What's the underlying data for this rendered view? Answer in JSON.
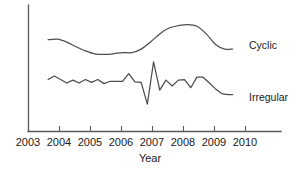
{
  "chart_data": {
    "type": "line",
    "title": "",
    "subtitle": "",
    "xlabel": "Year",
    "ylabel": "",
    "grid": false,
    "legend_position": "right-inline-labels",
    "xlim": [
      2003,
      2010
    ],
    "xticks": [
      2003,
      2004,
      2005,
      2006,
      2007,
      2008,
      2009,
      2010
    ],
    "xticklabels": [
      "2003",
      "2004",
      "2005",
      "2006",
      "2007",
      "2008",
      "2009",
      "2010"
    ],
    "ylim": [
      0,
      100
    ],
    "yticks": [],
    "yticklabels": [],
    "annotations": [
      {
        "name": "cyclic-label",
        "text": "Cyclic",
        "x": 2009.65,
        "y": 72
      },
      {
        "name": "irregular-label",
        "text": "Irregular",
        "x": 2009.65,
        "y": 32
      }
    ],
    "series": [
      {
        "name": "Cyclic",
        "label": "Cyclic",
        "color": "#4d4d4d",
        "style": "smooth",
        "x": [
          2003.65,
          2003.95,
          2004.25,
          2004.55,
          2004.85,
          2005.15,
          2005.45,
          2005.75,
          2006.05,
          2006.35,
          2006.65,
          2006.95,
          2007.25,
          2007.55,
          2007.85,
          2008.15,
          2008.45,
          2008.75,
          2009.05,
          2009.35,
          2009.6
        ],
        "y": [
          78,
          78.5,
          76,
          72,
          68.5,
          66,
          65.5,
          66,
          67,
          67,
          70,
          76,
          83,
          88,
          90,
          91,
          89.5,
          83,
          74,
          70,
          70
        ]
      },
      {
        "name": "Irregular",
        "label": "Irregular",
        "color": "#4d4d4d",
        "style": "zigzag",
        "x": [
          2003.65,
          2003.85,
          2004.05,
          2004.25,
          2004.45,
          2004.65,
          2004.85,
          2005.05,
          2005.25,
          2005.45,
          2005.65,
          2005.85,
          2006.05,
          2006.25,
          2006.45,
          2006.65,
          2006.85,
          2007.05,
          2007.25,
          2007.45,
          2007.65,
          2007.85,
          2008.05,
          2008.25,
          2008.45,
          2008.65,
          2008.85,
          2009.05,
          2009.25,
          2009.45,
          2009.6
        ],
        "y": [
          44,
          47,
          44,
          41,
          43.5,
          41,
          44,
          41.5,
          44,
          40.5,
          42.5,
          42.5,
          42.5,
          49,
          42,
          41.5,
          23,
          59,
          35,
          43.5,
          38.5,
          43.5,
          44,
          37,
          46,
          46,
          41,
          36,
          32,
          31,
          31
        ]
      }
    ]
  },
  "axes": {
    "year_label": "Year",
    "tick_2003": "2003",
    "tick_2004": "2004",
    "tick_2005": "2005",
    "tick_2006": "2006",
    "tick_2007": "2007",
    "tick_2008": "2008",
    "tick_2009": "2009",
    "tick_2010": "2010"
  },
  "labels": {
    "cyclic": "Cyclic",
    "irregular": "Irregular"
  },
  "colors": {
    "axis": "#595959",
    "line": "#4d4d4d",
    "text": "#1a1a1a",
    "background": "#ffffff"
  }
}
